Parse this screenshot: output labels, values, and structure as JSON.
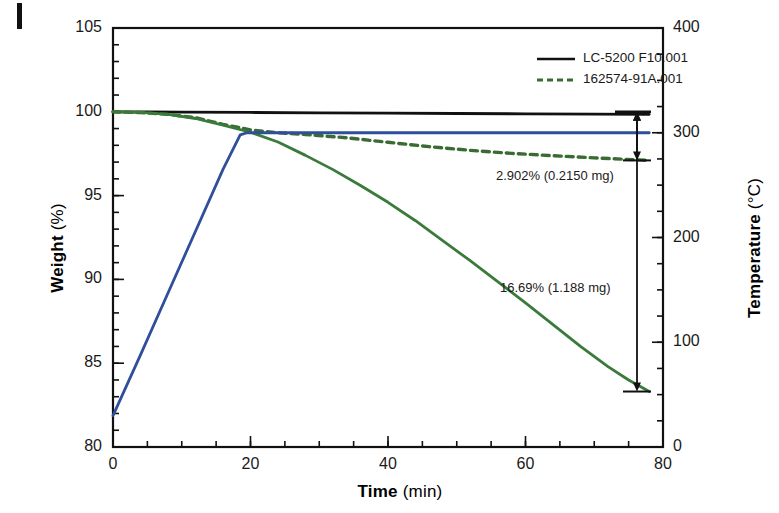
{
  "figure": {
    "panel_mark": "",
    "background": "#ffffff"
  },
  "chart_data": {
    "type": "line",
    "title": "",
    "xlabel_bold": "Time",
    "xlabel_unit": "(min)",
    "ylabel_left_bold": "Weight",
    "ylabel_left_unit": "(%)",
    "ylabel_right_bold": "Temperature",
    "ylabel_right_unit": "(°C)",
    "xlim": [
      0,
      80
    ],
    "xticks": [
      0,
      20,
      40,
      60,
      80
    ],
    "xtick_labels": [
      "0",
      "20",
      "40",
      "60",
      "80"
    ],
    "x_minor_step": 5,
    "ylim_left": [
      80,
      105
    ],
    "yticks_left": [
      80,
      85,
      90,
      95,
      100,
      105
    ],
    "ytick_labels_left": [
      "80",
      "85",
      "90",
      "95",
      "100",
      "105"
    ],
    "y_left_minor_step": 1,
    "ylim_right": [
      0,
      400
    ],
    "yticks_right": [
      0,
      100,
      200,
      300,
      400
    ],
    "ytick_labels_right": [
      "0",
      "100",
      "200",
      "300",
      "400"
    ],
    "y_right_minor_step": 25,
    "grid": false,
    "legend_position": "top-right",
    "series": [
      {
        "name": "LC-5200 F10.001",
        "style": "solid",
        "color": "#111111",
        "axis": "left",
        "legend": true,
        "points": [
          [
            0,
            100.0
          ],
          [
            5,
            100.0
          ],
          [
            10,
            99.98
          ],
          [
            20,
            99.96
          ],
          [
            30,
            99.94
          ],
          [
            40,
            99.92
          ],
          [
            50,
            99.9
          ],
          [
            60,
            99.88
          ],
          [
            70,
            99.86
          ],
          [
            78,
            99.85
          ]
        ]
      },
      {
        "name": "162574-91A.001",
        "style": "dashed",
        "color": "#3a6b33",
        "axis": "left",
        "legend": true,
        "points": [
          [
            0,
            100.0
          ],
          [
            4,
            99.95
          ],
          [
            8,
            99.85
          ],
          [
            12,
            99.65
          ],
          [
            16,
            99.25
          ],
          [
            20,
            98.92
          ],
          [
            24,
            98.75
          ],
          [
            28,
            98.65
          ],
          [
            34,
            98.45
          ],
          [
            40,
            98.18
          ],
          [
            46,
            97.92
          ],
          [
            52,
            97.7
          ],
          [
            58,
            97.52
          ],
          [
            64,
            97.38
          ],
          [
            70,
            97.25
          ],
          [
            78,
            97.1
          ]
        ]
      },
      {
        "name": "weight-loss-trace",
        "style": "solid",
        "color": "#3a7a3a",
        "axis": "left",
        "legend": false,
        "points": [
          [
            0,
            100.0
          ],
          [
            4,
            99.96
          ],
          [
            8,
            99.85
          ],
          [
            12,
            99.6
          ],
          [
            16,
            99.2
          ],
          [
            20,
            98.78
          ],
          [
            24,
            98.2
          ],
          [
            28,
            97.4
          ],
          [
            32,
            96.55
          ],
          [
            36,
            95.6
          ],
          [
            40,
            94.6
          ],
          [
            44,
            93.5
          ],
          [
            48,
            92.3
          ],
          [
            52,
            91.1
          ],
          [
            56,
            89.85
          ],
          [
            60,
            88.6
          ],
          [
            64,
            87.3
          ],
          [
            68,
            86.0
          ],
          [
            72,
            84.8
          ],
          [
            75,
            84.0
          ],
          [
            78,
            83.31
          ]
        ]
      },
      {
        "name": "temperature-program",
        "style": "solid",
        "color": "#2f4f9b",
        "axis": "right",
        "legend": false,
        "points": [
          [
            0,
            30
          ],
          [
            4,
            88
          ],
          [
            8,
            147
          ],
          [
            12,
            206
          ],
          [
            16,
            265
          ],
          [
            18.5,
            298
          ],
          [
            19.5,
            300
          ],
          [
            24,
            300
          ],
          [
            32,
            300
          ],
          [
            44,
            300
          ],
          [
            56,
            300
          ],
          [
            68,
            300
          ],
          [
            78,
            300
          ]
        ]
      }
    ],
    "legend_entries": [
      {
        "label": "LC-5200 F10.001",
        "style": "solid",
        "color": "#111111"
      },
      {
        "label": "162574-91A.001",
        "style": "dashed",
        "color": "#3a6b33"
      }
    ],
    "annotations": [
      {
        "text": "2.902% (0.2150 mg)",
        "arrow": "double",
        "from_percent": 100.0,
        "to_percent": 97.1
      },
      {
        "text": "16.69% (1.188 mg)",
        "arrow": "double",
        "from_percent": 100.0,
        "to_percent": 83.31
      }
    ]
  }
}
